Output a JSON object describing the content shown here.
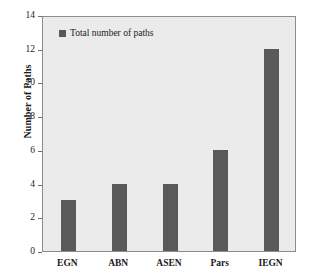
{
  "chart_data": {
    "type": "bar",
    "title": "",
    "xlabel": "",
    "ylabel": "Number of Paths",
    "categories": [
      "EGN",
      "ABN",
      "ASEN",
      "Pars",
      "IEGN"
    ],
    "values": [
      3,
      4,
      4,
      6,
      12
    ],
    "series": [
      {
        "name": "Total number of paths",
        "values": [
          3,
          4,
          4,
          6,
          12
        ],
        "color": "#595959"
      }
    ],
    "ylim": [
      0,
      14
    ],
    "yticks": [
      0,
      2,
      4,
      6,
      8,
      10,
      12,
      14
    ],
    "ytick_labels": [
      "0",
      "2",
      "4",
      "6",
      "8",
      "10",
      "12",
      "14"
    ],
    "grid": false,
    "legend_position": "top-left",
    "legend_entries": [
      "Total number of paths"
    ],
    "plot_background": "#ebebeb",
    "figure_background": "#ffffff",
    "axis_color": "#8c8c8c"
  },
  "legend": {
    "label": "Total number of paths",
    "swatch_name": "legend-swatch-total-number-of-paths"
  },
  "axes": {
    "y_label": "Number of Paths"
  }
}
